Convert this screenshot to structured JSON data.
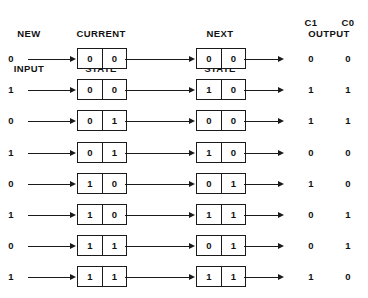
{
  "headers": {
    "new_input_line1": "NEW",
    "new_input_line2": "INPUT",
    "current_state_line1": "CURRENT",
    "current_state_line2": "STATE",
    "next_state_line1": "NEXT",
    "next_state_line2": "STATE",
    "output": "OUTPUT",
    "output_c1": "C1",
    "output_c0": "C0"
  },
  "colors": {
    "ink": "#1a1a1a",
    "text": "#111111",
    "background": "#ffffff"
  },
  "table_data": {
    "type": "table",
    "title": "State Transition Table",
    "columns": [
      "NEW INPUT",
      "CURRENT STATE",
      "NEXT STATE",
      "OUTPUT C1",
      "OUTPUT C0"
    ],
    "rows": [
      {
        "new_input": "0",
        "current_state": [
          "0",
          "0"
        ],
        "next_state": [
          "0",
          "0"
        ],
        "c1": "0",
        "c0": "0"
      },
      {
        "new_input": "1",
        "current_state": [
          "0",
          "0"
        ],
        "next_state": [
          "1",
          "0"
        ],
        "c1": "1",
        "c0": "1"
      },
      {
        "new_input": "0",
        "current_state": [
          "0",
          "1"
        ],
        "next_state": [
          "0",
          "0"
        ],
        "c1": "1",
        "c0": "1"
      },
      {
        "new_input": "1",
        "current_state": [
          "0",
          "1"
        ],
        "next_state": [
          "1",
          "0"
        ],
        "c1": "0",
        "c0": "0"
      },
      {
        "new_input": "0",
        "current_state": [
          "1",
          "0"
        ],
        "next_state": [
          "0",
          "1"
        ],
        "c1": "1",
        "c0": "0"
      },
      {
        "new_input": "1",
        "current_state": [
          "1",
          "0"
        ],
        "next_state": [
          "1",
          "1"
        ],
        "c1": "0",
        "c0": "1"
      },
      {
        "new_input": "0",
        "current_state": [
          "1",
          "1"
        ],
        "next_state": [
          "0",
          "1"
        ],
        "c1": "0",
        "c0": "1"
      },
      {
        "new_input": "1",
        "current_state": [
          "1",
          "1"
        ],
        "next_state": [
          "1",
          "1"
        ],
        "c1": "1",
        "c0": "0"
      }
    ]
  }
}
